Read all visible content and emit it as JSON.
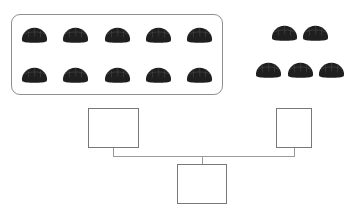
{
  "worksheet": {
    "icon_name": "bread-roll-icon",
    "object_color": "#1f1f1f",
    "frame_color": "#8e8e8e",
    "box_border_color": "#787878",
    "connector_color": "#9a9a9a",
    "background_color": "#ffffff"
  },
  "groups": [
    {
      "name": "grouped-ten",
      "framed": true,
      "count": 10,
      "rows": [
        5,
        5
      ],
      "frame": {
        "x": 11,
        "y": 14,
        "width": 212,
        "height": 81
      }
    },
    {
      "name": "loose-ones",
      "framed": false,
      "count": 5,
      "rows": [
        2,
        3
      ],
      "frame": {
        "x": 255,
        "y": 24,
        "width": 90,
        "height": 54
      }
    }
  ],
  "total_objects": 15,
  "answer_boxes": [
    {
      "name": "tens-value-box",
      "value": "",
      "placeholder": "",
      "x": 88,
      "y": 108,
      "width": 51,
      "height": 40
    },
    {
      "name": "ones-value-box",
      "value": "",
      "placeholder": "",
      "x": 276,
      "y": 108,
      "width": 36,
      "height": 40
    },
    {
      "name": "total-value-box",
      "value": "",
      "placeholder": "",
      "x": 177,
      "y": 164,
      "width": 50,
      "height": 40
    }
  ],
  "connectors": [
    {
      "name": "left-branch-drop",
      "orientation": "v",
      "x": 113,
      "y": 148,
      "length": 8
    },
    {
      "name": "right-branch-drop",
      "orientation": "v",
      "x": 294,
      "y": 148,
      "length": 8
    },
    {
      "name": "join-bar",
      "orientation": "h",
      "x": 113,
      "y": 156,
      "length": 182
    },
    {
      "name": "total-drop",
      "orientation": "v",
      "x": 202,
      "y": 156,
      "length": 8
    }
  ]
}
